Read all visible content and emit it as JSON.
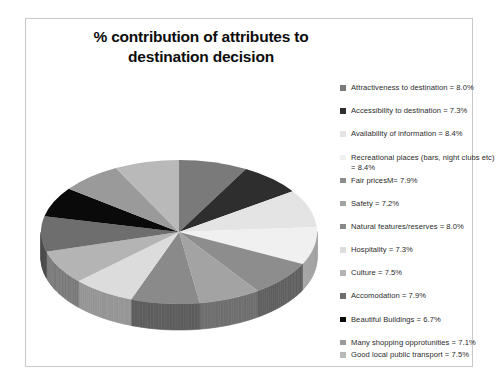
{
  "document": {
    "background_color": "#ffffff",
    "frame_border_color": "#c9c9c9"
  },
  "title": {
    "line1": "% contribution of attributes to",
    "line2": "destination decision",
    "full": "% contribution of attributes to destination decision",
    "color": "#0d0d0d"
  },
  "legend": {
    "position": "right",
    "items": [
      {
        "label": "Attractiveness to destination = 8.0%",
        "color": "#7a7a7a"
      },
      {
        "label": "Accessibility to destination =  7.3%",
        "color": "#2e2e2e"
      },
      {
        "label": "Availability of information = 8.4%",
        "color": "#e4e4e4"
      },
      {
        "label": "Recreational places  (bars, night clubs etc) = 8.4%",
        "color": "#f0f0f0"
      },
      {
        "label": "Fair pricesM= 7.9%",
        "color": "#8d8d8d"
      },
      {
        "label": "Safety = 7.2%",
        "color": "#a3a3a3"
      },
      {
        "label": "Natural features/reserves  = 8.0%",
        "color": "#8a8a8a"
      },
      {
        "label": "Hospitality = 7.3%",
        "color": "#dcdcdc"
      },
      {
        "label": "Culture = 7.5%",
        "color": "#b4b4b4"
      },
      {
        "label": "Accomodation = 7.9%",
        "color": "#6e6e6e"
      },
      {
        "label": "Beautiful Buildings = 6.7%",
        "color": "#0a0a0a"
      },
      {
        "label": "Many shopping opprotunities = 7.1%",
        "color": "#9a9a9a"
      },
      {
        "label": "Good local public transport = 7.5%",
        "color": "#b9b9b9"
      }
    ]
  },
  "chart_data": {
    "type": "pie",
    "title": "% contribution of attributes to destination decision",
    "style": "3d-pie",
    "units": "percent",
    "legend_position": "right",
    "grid": false,
    "categories": [
      "Attractiveness to destination",
      "Accessibility to destination",
      "Availability of information",
      "Recreational places  (bars, night clubs etc)",
      "Fair pricesM",
      "Safety",
      "Natural features/reserves",
      "Hospitality",
      "Culture",
      "Accomodation",
      "Beautiful Buildings",
      "Many shopping opprotunities",
      "Good local public transport"
    ],
    "values": [
      8.0,
      7.3,
      8.4,
      8.4,
      7.9,
      7.2,
      8.0,
      7.3,
      7.5,
      7.9,
      6.7,
      7.1,
      7.5
    ],
    "colors": [
      "#7a7a7a",
      "#2e2e2e",
      "#e4e4e4",
      "#f0f0f0",
      "#8d8d8d",
      "#a3a3a3",
      "#8a8a8a",
      "#dcdcdc",
      "#b4b4b4",
      "#6e6e6e",
      "#0a0a0a",
      "#9a9a9a",
      "#b9b9b9"
    ],
    "total": 100.2,
    "xlabel": "",
    "ylabel": ""
  }
}
